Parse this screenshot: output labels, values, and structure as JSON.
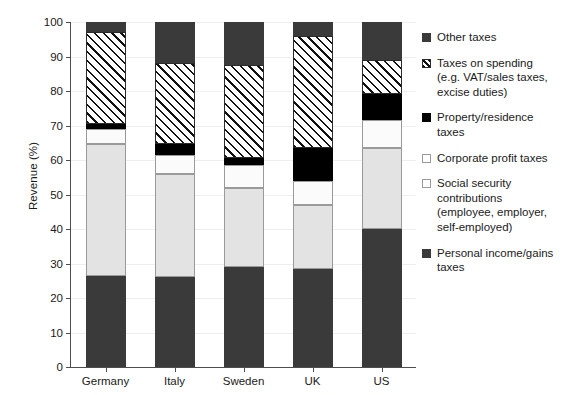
{
  "chart_data": {
    "type": "bar",
    "subtype": "stacked-bar-100",
    "title": "",
    "xlabel": "",
    "ylabel": "Revenue (%)",
    "ylim": [
      0,
      100
    ],
    "ytick_labels": [
      "0",
      "10",
      "20",
      "30",
      "40",
      "50",
      "60",
      "70",
      "80",
      "90",
      "100"
    ],
    "ytick_values": [
      0,
      10,
      20,
      30,
      40,
      50,
      60,
      70,
      80,
      90,
      100
    ],
    "grid": true,
    "legend_position": "right",
    "categories": [
      "Germany",
      "Italy",
      "Sweden",
      "UK",
      "US"
    ],
    "series": [
      {
        "name": "Personal income/gains taxes",
        "key": "personal",
        "fill": "solid-dark",
        "color": "#3a3a3a",
        "values": [
          26.5,
          26.0,
          29.0,
          28.5,
          40.0
        ]
      },
      {
        "name": "Social security contributions (employee, employer, self-employed)",
        "key": "social",
        "fill": "solid-light",
        "color": "#e3e3e3",
        "values": [
          38.0,
          30.0,
          23.0,
          18.5,
          23.5
        ]
      },
      {
        "name": "Corporate profit taxes",
        "key": "corporate",
        "fill": "open-white",
        "color": "#fbfbfb",
        "values": [
          4.5,
          5.5,
          6.5,
          7.0,
          8.0
        ]
      },
      {
        "name": "Property/residence taxes",
        "key": "property",
        "fill": "solid-black",
        "color": "#000000",
        "values": [
          1.5,
          3.0,
          2.0,
          9.5,
          7.5
        ]
      },
      {
        "name": "Taxes on spending (e.g. VAT/sales taxes, excise duties)",
        "key": "spending",
        "fill": "hatched",
        "color": "#ffffff",
        "values": [
          26.5,
          23.5,
          27.0,
          32.5,
          10.0
        ]
      },
      {
        "name": "Other taxes",
        "key": "other",
        "fill": "solid-dark",
        "color": "#3a3a3a",
        "values": [
          3.0,
          12.0,
          12.5,
          4.0,
          11.0
        ]
      }
    ],
    "cumulative_tops": {
      "Germany": [
        26.5,
        64.5,
        69.0,
        70.5,
        97.0,
        100.0
      ],
      "Italy": [
        26.0,
        56.0,
        61.5,
        64.5,
        88.0,
        100.0
      ],
      "Sweden": [
        29.0,
        52.0,
        58.5,
        60.5,
        87.5,
        100.0
      ],
      "UK": [
        28.5,
        47.0,
        54.0,
        63.5,
        96.0,
        100.0
      ],
      "US": [
        40.0,
        63.5,
        71.5,
        79.0,
        89.0,
        100.0
      ]
    }
  },
  "legend": {
    "items": [
      {
        "label": "Other taxes",
        "swatch": "solid-dark"
      },
      {
        "label": "Taxes on spending\n(e.g. VAT/sales taxes,\nexcise duties)",
        "swatch": "hatched"
      },
      {
        "label": "Property/residence\ntaxes",
        "swatch": "solid-black"
      },
      {
        "label": "Corporate profit taxes",
        "swatch": "open-white"
      },
      {
        "label": "Social security\ncontributions\n(employee, employer,\nself-employed)",
        "swatch": "open-white"
      },
      {
        "label": "Personal income/gains\ntaxes",
        "swatch": "solid-dark"
      }
    ]
  },
  "colors": {
    "dark_gray": "#3a3a3a",
    "black": "#000000",
    "light_gray": "#e3e3e3",
    "white": "#ffffff",
    "axis": "#4d4d4d",
    "gridline": "#eeeeee"
  }
}
